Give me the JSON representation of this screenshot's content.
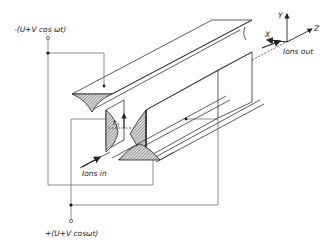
{
  "diagram": {
    "labels": {
      "top_voltage": "-(U+V cos ωt)",
      "bottom_voltage": "+(U+V cosωt)",
      "ions_in": "Ions in",
      "ions_out": "Ions out",
      "r0_main": "r",
      "r0_sub": "0",
      "axis_x": "X",
      "axis_y": "Y",
      "axis_z": "Z"
    },
    "components": [
      {
        "name": "top-rod",
        "type": "hyperbolic electrode"
      },
      {
        "name": "bottom-rod",
        "type": "hyperbolic electrode"
      },
      {
        "name": "left-rod",
        "type": "hyperbolic electrode"
      },
      {
        "name": "right-rod",
        "type": "hyperbolic electrode"
      }
    ],
    "colors": {
      "line": "#333333",
      "hatch": "#555555",
      "background": "#ffffff"
    }
  }
}
